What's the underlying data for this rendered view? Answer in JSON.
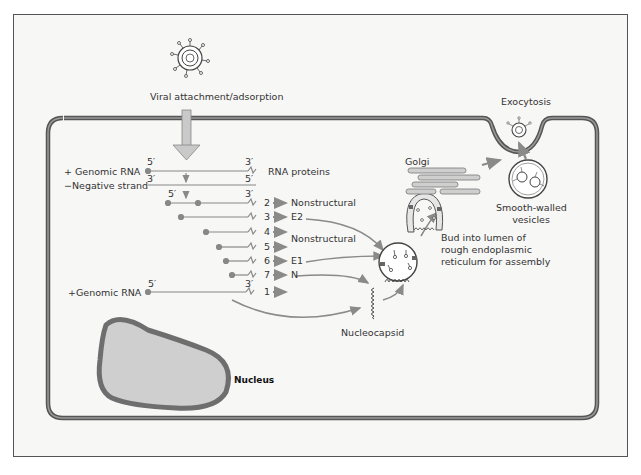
{
  "diagram": {
    "type": "viral replication cycle (togavirus) in host cell",
    "extracellular": {
      "virion_label": "Viral attachment/adsorption",
      "exocytosis_label": "Exocytosis"
    },
    "rna": {
      "plus_genomic_label": "+ Genomic RNA",
      "negative_strand_label": "−Negative strand",
      "plus_genomic_label_2": "+Genomic RNA",
      "five_prime": "5′",
      "three_prime": "3′",
      "rna_proteins_header": "RNA proteins"
    },
    "proteins": [
      {
        "num": "2",
        "label": "Nonstructural"
      },
      {
        "num": "3",
        "label": "E2"
      },
      {
        "num": "4",
        "label": ""
      },
      {
        "num": "5",
        "label": "Nonstructural"
      },
      {
        "num": "6",
        "label": "E1"
      },
      {
        "num": "7",
        "label": "N"
      },
      {
        "num": "1",
        "label": ""
      }
    ],
    "organelles": {
      "golgi": "Golgi",
      "smooth_vesicles_line1": "Smooth-walled",
      "smooth_vesicles_line2": "vesicles",
      "bud_line1": "Bud into lumen of",
      "bud_line2": "rough endoplasmic",
      "bud_line3": "reticulum for assembly",
      "nucleocapsid": "Nucleocapsid",
      "nucleus": "Nucleus"
    },
    "colors": {
      "membrane": "#555555",
      "arrow": "#8a8a8a",
      "nucleus_fill": "#cfcfcf",
      "nucleus_border": "#6e6e6e",
      "background": "#f7f7f6"
    }
  }
}
